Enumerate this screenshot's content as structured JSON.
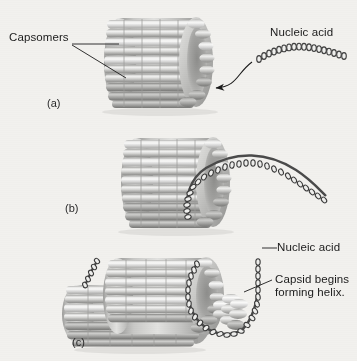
{
  "figure": {
    "title_text": "",
    "background_color": "#f2f1ee",
    "ink_color": "#1b1b1b",
    "capsid_light": "#f1f1f0",
    "capsid_mid": "#c3c3c1",
    "capsid_dark": "#8f8f8d",
    "nucleic_acid_color": "#4a4a4a",
    "type": "helical-virus-self-assembly-diagram"
  },
  "panels": [
    {
      "letter": "(a)",
      "labels": [
        {
          "text": "Capsomers",
          "target": "capsid-rods"
        },
        {
          "text": "Nucleic acid",
          "target": "free-nucleic-acid-strand"
        }
      ]
    },
    {
      "letter": "(b)",
      "labels": []
    },
    {
      "letter": "(c)",
      "labels": [
        {
          "text": "Nucleic acid",
          "target": "threaded-nucleic-acid"
        },
        {
          "text": "Capsid begins",
          "target": "elongating-capsid"
        },
        {
          "text": "forming helix.",
          "target": "elongating-capsid"
        }
      ]
    }
  ],
  "labels": {
    "capsomers": "Capsomers",
    "nucleic_acid_a": "Nucleic acid",
    "nucleic_acid_c": "Nucleic acid",
    "capsid_helix_line1": "Capsid begins",
    "capsid_helix_line2": "forming helix.",
    "letter_a": "(a)",
    "letter_b": "(b)",
    "letter_c": "(c)"
  }
}
